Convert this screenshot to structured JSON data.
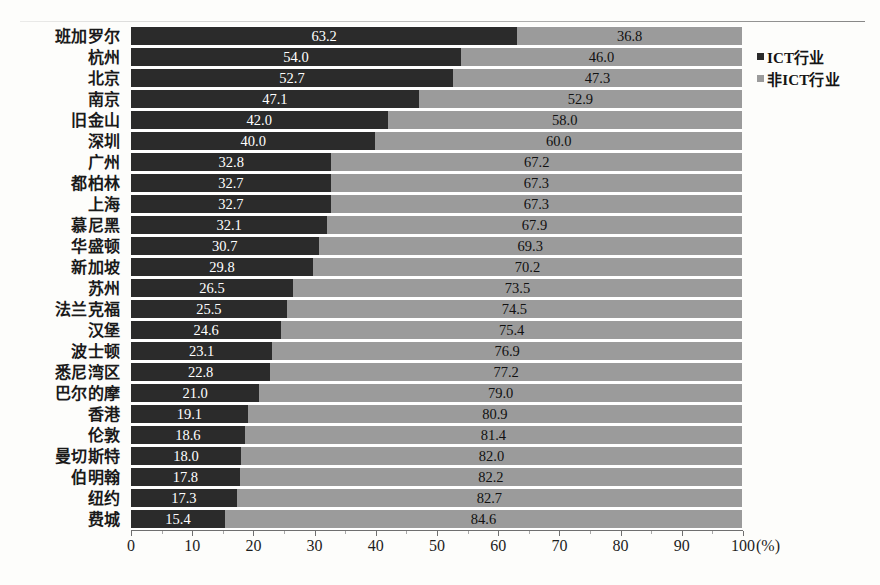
{
  "chart_data": {
    "type": "bar",
    "subtype": "stacked-horizontal-100-percent",
    "title": "",
    "xlabel": "(%)",
    "ylabel": "",
    "xlim": [
      0,
      100
    ],
    "xticks": [
      0,
      10,
      20,
      30,
      40,
      50,
      60,
      70,
      80,
      90,
      100
    ],
    "xtick_labels": [
      "0",
      "10",
      "20",
      "30",
      "40",
      "50",
      "60",
      "70",
      "80",
      "90",
      "100"
    ],
    "unit_label": "(%)",
    "grid": false,
    "legend_position": "right-top",
    "orientation": "horizontal",
    "categories": [
      "班加罗尔",
      "杭州",
      "北京",
      "南京",
      "旧金山",
      "深圳",
      "广州",
      "都柏林",
      "上海",
      "慕尼黑",
      "华盛顿",
      "新加坡",
      "苏州",
      "法兰克福",
      "汉堡",
      "波士顿",
      "悉尼湾区",
      "巴尔的摩",
      "香港",
      "伦敦",
      "曼切斯特",
      "伯明翰",
      "纽约",
      "费城"
    ],
    "series": [
      {
        "name": "ICT行业",
        "color": "#2b2b2b",
        "values": [
          63.2,
          54.0,
          52.7,
          47.1,
          42.0,
          40.0,
          32.8,
          32.7,
          32.7,
          32.1,
          30.7,
          29.8,
          26.5,
          25.5,
          24.6,
          23.1,
          22.8,
          21.0,
          19.1,
          18.6,
          18.0,
          17.8,
          17.3,
          15.4
        ],
        "labels": [
          "63.2",
          "54.0",
          "52.7",
          "47.1",
          "42.0",
          "40.0",
          "32.8",
          "32.7",
          "32.7",
          "32.1",
          "30.7",
          "29.8",
          "26.5",
          "25.5",
          "24.6",
          "23.1",
          "22.8",
          "21.0",
          "19.1",
          "18.6",
          "18.0",
          "17.8",
          "17.3",
          "15.4"
        ]
      },
      {
        "name": "非ICT行业",
        "color": "#9b9b9b",
        "values": [
          36.8,
          46.0,
          47.3,
          52.9,
          58.0,
          60.0,
          67.2,
          67.3,
          67.3,
          67.9,
          69.3,
          70.2,
          73.5,
          74.5,
          75.4,
          76.9,
          77.2,
          79.0,
          80.9,
          81.4,
          82.0,
          82.2,
          82.7,
          84.6
        ],
        "labels": [
          "36.8",
          "46.0",
          "47.3",
          "52.9",
          "58.0",
          "60.0",
          "67.2",
          "67.3",
          "67.3",
          "67.9",
          "69.3",
          "70.2",
          "73.5",
          "74.5",
          "75.4",
          "76.9",
          "77.2",
          "79.0",
          "80.9",
          "81.4",
          "82.0",
          "82.2",
          "82.7",
          "84.6"
        ]
      }
    ]
  },
  "legend": {
    "items": [
      {
        "label": "ICT行业",
        "color": "#2b2b2b"
      },
      {
        "label": "非ICT行业",
        "color": "#9b9b9b"
      }
    ]
  },
  "colors": {
    "ict": "#2b2b2b",
    "non_ict": "#9b9b9b",
    "background": "#fdfdfb",
    "axis": "#6f6f6f",
    "text": "#1a1a1a",
    "value_on_dark": "#ffffff",
    "value_on_gray": "#111111"
  }
}
